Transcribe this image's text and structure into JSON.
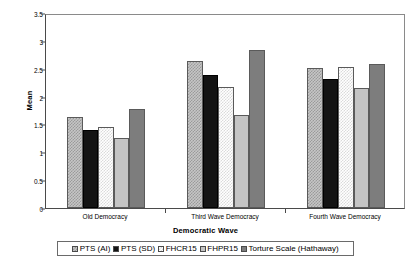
{
  "chart_data": {
    "type": "bar",
    "title": "",
    "xlabel": "Democratic Wave",
    "ylabel": "Mean",
    "ylim": [
      0,
      3.5
    ],
    "yticks": [
      "0",
      "0.5",
      "1",
      "1.5",
      "2",
      "2.5",
      "3",
      "3.5"
    ],
    "ytick_values": [
      0,
      0.5,
      1,
      1.5,
      2,
      2.5,
      3,
      3.5
    ],
    "grid": false,
    "legend_position": "bottom",
    "categories": [
      "Old Democracy",
      "Third Wave Democracy",
      "Fourth Wave Democracy"
    ],
    "series": [
      {
        "name": "PTS (AI)",
        "pattern": "checker-medium",
        "color": "#c6c6c6",
        "values": [
          1.63,
          2.64,
          2.51
        ]
      },
      {
        "name": "PTS (SD)",
        "pattern": "solid",
        "color": "#141414",
        "values": [
          1.4,
          2.39,
          2.32
        ]
      },
      {
        "name": "FHCR15",
        "pattern": "checker-light",
        "color": "#ffffff",
        "values": [
          1.45,
          2.17,
          2.53
        ]
      },
      {
        "name": "FHPR15",
        "pattern": "solid",
        "color": "#c4c4c4",
        "values": [
          1.26,
          1.67,
          2.15
        ]
      },
      {
        "name": "Torture Scale (Hathaway)",
        "pattern": "solid",
        "color": "#7d7d7d",
        "values": [
          1.78,
          2.84,
          2.59
        ]
      }
    ]
  },
  "axes": {
    "y_label": "Mean",
    "x_label": "Democratic Wave"
  },
  "colors": {
    "axis": "#4a4a4a",
    "frame": "#8a8a8a",
    "background": "#ffffff"
  }
}
